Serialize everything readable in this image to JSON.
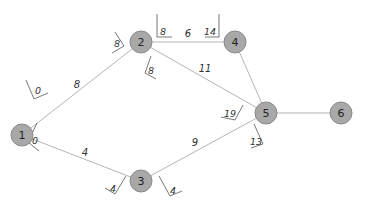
{
  "diagram": {
    "type": "network-graph",
    "nodes": [
      {
        "id": "1",
        "label": "1",
        "x": 22,
        "y": 64
      },
      {
        "id": "2",
        "label": "2",
        "x": 141,
        "y": 42
      },
      {
        "id": "3",
        "label": "3",
        "x": 141,
        "y": 181
      },
      {
        "id": "4",
        "label": "4",
        "x": 235,
        "y": 42
      },
      {
        "id": "5",
        "label": "5",
        "x": 266,
        "y": 113
      },
      {
        "id": "6",
        "label": "6",
        "x": 341,
        "y": 113
      }
    ],
    "edges": [
      {
        "from": "1",
        "to": "2",
        "weight": "8"
      },
      {
        "from": "1",
        "to": "3",
        "weight": "4"
      },
      {
        "from": "2",
        "to": "4",
        "weight": "6"
      },
      {
        "from": "2",
        "to": "5",
        "weight": "11"
      },
      {
        "from": "3",
        "to": "5",
        "weight": "9"
      },
      {
        "from": "4",
        "to": "5",
        "weight": ""
      },
      {
        "from": "5",
        "to": "6",
        "weight": ""
      }
    ],
    "node_tags": {
      "n1_top": "0",
      "n1_bottom": "0",
      "n2_left": "8",
      "n2_top": "8",
      "n2_bottom": "8",
      "n4_left": "14",
      "n3_left": "4",
      "n3_right": "4",
      "n5_left": "19",
      "n5_bottom": "13"
    }
  }
}
